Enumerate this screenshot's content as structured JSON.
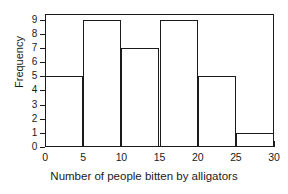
{
  "chart_data": {
    "type": "bar",
    "title": "",
    "xlabel": "Number of people bitten by alligators",
    "ylabel": "Frequency",
    "bin_width": 5,
    "bin_edges": [
      0,
      5,
      10,
      15,
      20,
      25,
      30
    ],
    "categories": [
      "0-5",
      "5-10",
      "10-15",
      "15-20",
      "20-25",
      "25-30"
    ],
    "values": [
      5,
      9,
      7,
      9,
      5,
      1
    ],
    "x": [
      0,
      5,
      10,
      15,
      20,
      25,
      30
    ],
    "xlim": [
      0,
      30
    ],
    "ylim": [
      0,
      9.4
    ],
    "xticks": [
      "0",
      "5",
      "10",
      "15",
      "20",
      "25",
      "30"
    ],
    "yticks": [
      "0",
      "1",
      "2",
      "3",
      "4",
      "5",
      "6",
      "7",
      "8",
      "9"
    ],
    "grid": false,
    "legend": false,
    "legend_position": "none",
    "bar_fill_color": "#ffffff",
    "bar_edge_color": "#1a1a1a",
    "axis_color": "#1a1a1a",
    "background_color": "#ffffff"
  }
}
